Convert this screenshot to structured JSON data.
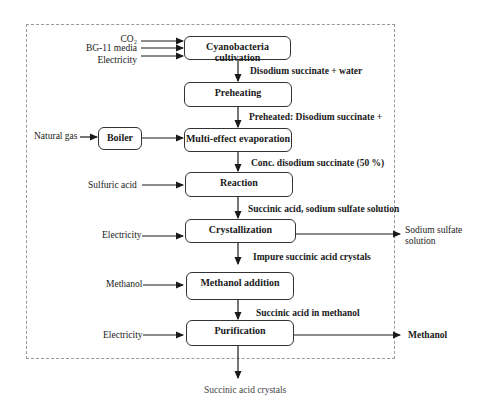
{
  "diagram": {
    "type": "process-flow",
    "process_boxes": [
      {
        "id": "cultivation",
        "label": "Cyanobacteria cultivation"
      },
      {
        "id": "preheating",
        "label": "Preheating"
      },
      {
        "id": "evaporation",
        "label": "Multi-effect evaporation"
      },
      {
        "id": "reaction",
        "label": "Reaction"
      },
      {
        "id": "crystallization",
        "label": "Crystallization"
      },
      {
        "id": "methanol_addition",
        "label": "Methanol addition"
      },
      {
        "id": "purification",
        "label": "Purification"
      }
    ],
    "utility_boxes": [
      {
        "id": "boiler",
        "label": "Boiler"
      }
    ],
    "inputs": {
      "co2": "CO₂",
      "bg11": "BG-11 media",
      "electricity_1": "Electricity",
      "natural_gas": "Natural gas",
      "sulfuric_acid": "Sulfuric acid",
      "electricity_2": "Electricity",
      "methanol": "Methanol",
      "electricity_3": "Electricity"
    },
    "streams": {
      "s1": "Disodium succinate + water",
      "s2": "Preheated: Disodium succinate +",
      "s3": "Conc. disodium succinate (50 %)",
      "s4": "Succinic acid, sodium sulfate solution",
      "s5": "Impure succinic acid crystals",
      "s6": "Succinic acid in methanol"
    },
    "outputs": {
      "sodium_sulfate_line1": "Sodium sulfate",
      "sodium_sulfate_line2": "solution",
      "methanol_out": "Methanol",
      "product": "Succinic acid crystals"
    }
  }
}
